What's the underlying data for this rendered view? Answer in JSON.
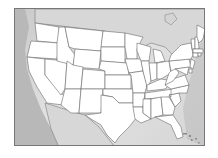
{
  "map": {
    "type": "blank-outline-map",
    "region": "United States (contiguous)",
    "labels_visible": false,
    "colors": {
      "state_fill": "#ffffff",
      "border": "#6a6a6a",
      "surrounding_land": "#d7d7d7",
      "ocean": "#b8b8b8",
      "frame": "#777777"
    },
    "states": [
      "WA",
      "OR",
      "CA",
      "NV",
      "ID",
      "MT",
      "WY",
      "UT",
      "AZ",
      "CO",
      "NM",
      "ND",
      "SD",
      "NE",
      "KS",
      "OK",
      "TX",
      "MN",
      "IA",
      "MO",
      "AR",
      "LA",
      "WI",
      "IL",
      "MI",
      "IN",
      "OH",
      "KY",
      "TN",
      "MS",
      "AL",
      "GA",
      "FL",
      "SC",
      "NC",
      "VA",
      "WV",
      "PA",
      "NY",
      "VT",
      "NH",
      "ME",
      "MA",
      "CT",
      "RI",
      "NJ",
      "DE",
      "MD"
    ]
  }
}
